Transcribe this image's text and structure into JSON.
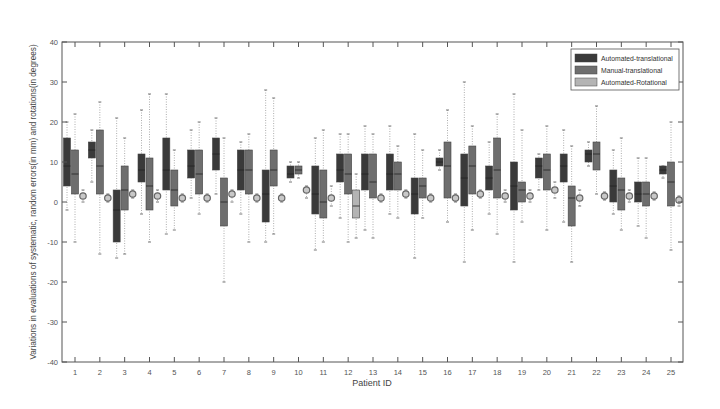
{
  "chart_data": {
    "type": "boxplot",
    "title": "",
    "xlabel": "Patient ID",
    "ylabel": "Variations in evaluations of systematic, random errors(in mm) and rotations(in degrees)",
    "ylim": [
      -40,
      40
    ],
    "yticks": [
      -40,
      -30,
      -20,
      -10,
      0,
      10,
      20,
      30,
      40
    ],
    "categories": [
      "1",
      "2",
      "3",
      "4",
      "5",
      "6",
      "7",
      "8",
      "9",
      "10",
      "11",
      "12",
      "13",
      "14",
      "15",
      "16",
      "17",
      "18",
      "19",
      "20",
      "21",
      "22",
      "23",
      "24",
      "25"
    ],
    "grid": false,
    "legend_position": "top-right",
    "series": [
      {
        "name": "Automated-translational",
        "color": "#3a3a3a",
        "boxes": [
          {
            "min": -2,
            "q1": 4,
            "median": 9,
            "q3": 16,
            "max": 20
          },
          {
            "min": 5,
            "q1": 11,
            "median": 13,
            "q3": 15,
            "max": 18
          },
          {
            "min": -14,
            "q1": -10,
            "median": -2,
            "q3": 3,
            "max": 21
          },
          {
            "min": -3,
            "q1": 5,
            "median": 8,
            "q3": 12,
            "max": 23
          },
          {
            "min": -8,
            "q1": 3,
            "median": 8,
            "q3": 16,
            "max": 27
          },
          {
            "min": 1,
            "q1": 6,
            "median": 9,
            "q3": 13,
            "max": 18
          },
          {
            "min": 2,
            "q1": 8,
            "median": 12,
            "q3": 16,
            "max": 21
          },
          {
            "min": -3,
            "q1": 3,
            "median": 8,
            "q3": 13,
            "max": 15
          },
          {
            "min": -10,
            "q1": -5,
            "median": 2,
            "q3": 8,
            "max": 28
          },
          {
            "min": 5,
            "q1": 6,
            "median": 7,
            "q3": 9,
            "max": 10
          },
          {
            "min": -12,
            "q1": -3,
            "median": 2,
            "q3": 9,
            "max": 16
          },
          {
            "min": -4,
            "q1": 5,
            "median": 8,
            "q3": 12,
            "max": 17
          },
          {
            "min": -7,
            "q1": 3,
            "median": 7,
            "q3": 12,
            "max": 19
          },
          {
            "min": -3,
            "q1": 3,
            "median": 7,
            "q3": 12,
            "max": 19
          },
          {
            "min": -14,
            "q1": -3,
            "median": 2,
            "q3": 6,
            "max": 17
          },
          {
            "min": 8,
            "q1": 9,
            "median": 10,
            "q3": 11,
            "max": 13
          },
          {
            "min": -15,
            "q1": -1,
            "median": 6,
            "q3": 12,
            "max": 30
          },
          {
            "min": -3,
            "q1": 3,
            "median": 6,
            "q3": 9,
            "max": 15
          },
          {
            "min": -15,
            "q1": -2,
            "median": 4,
            "q3": 10,
            "max": 27
          },
          {
            "min": 3,
            "q1": 6,
            "median": 9,
            "q3": 11,
            "max": 12
          },
          {
            "min": -5,
            "q1": 5,
            "median": 9,
            "q3": 12,
            "max": 18
          },
          {
            "min": 9,
            "q1": 10,
            "median": 12,
            "q3": 13,
            "max": 15
          },
          {
            "min": -3,
            "q1": 0,
            "median": 4,
            "q3": 8,
            "max": 13
          },
          {
            "min": -6,
            "q1": 0,
            "median": 2,
            "q3": 5,
            "max": 11
          },
          {
            "min": 6,
            "q1": 7,
            "median": 8,
            "q3": 9,
            "max": 9
          }
        ]
      },
      {
        "name": "Manual-translational",
        "color": "#6e6e6e",
        "boxes": [
          {
            "min": -10,
            "q1": 2,
            "median": 7,
            "q3": 13,
            "max": 22
          },
          {
            "min": -13,
            "q1": 2,
            "median": 9,
            "q3": 18,
            "max": 25
          },
          {
            "min": -13,
            "q1": -2,
            "median": 3,
            "q3": 9,
            "max": 16
          },
          {
            "min": -10,
            "q1": -2,
            "median": 4,
            "q3": 11,
            "max": 27
          },
          {
            "min": -7,
            "q1": -1,
            "median": 3,
            "q3": 8,
            "max": 13
          },
          {
            "min": -3,
            "q1": 2,
            "median": 7,
            "q3": 13,
            "max": 20
          },
          {
            "min": -20,
            "q1": -6,
            "median": 0,
            "q3": 6,
            "max": 16
          },
          {
            "min": -10,
            "q1": 2,
            "median": 8,
            "q3": 13,
            "max": 17
          },
          {
            "min": -8,
            "q1": 4,
            "median": 8,
            "q3": 13,
            "max": 26
          },
          {
            "min": 6,
            "q1": 7,
            "median": 8,
            "q3": 9,
            "max": 10
          },
          {
            "min": -10,
            "q1": -4,
            "median": 0,
            "q3": 8,
            "max": 18
          },
          {
            "min": -10,
            "q1": 2,
            "median": 7,
            "q3": 12,
            "max": 17
          },
          {
            "min": -9,
            "q1": 1,
            "median": 5,
            "q3": 12,
            "max": 17
          },
          {
            "min": -4,
            "q1": 3,
            "median": 7,
            "q3": 10,
            "max": 14
          },
          {
            "min": -4,
            "q1": 1,
            "median": 4,
            "q3": 6,
            "max": 13
          },
          {
            "min": -5,
            "q1": 1,
            "median": 9,
            "q3": 15,
            "max": 23
          },
          {
            "min": -7,
            "q1": 2,
            "median": 9,
            "q3": 14,
            "max": 19
          },
          {
            "min": -8,
            "q1": 1,
            "median": 8,
            "q3": 16,
            "max": 22
          },
          {
            "min": -5,
            "q1": 0,
            "median": 3,
            "q3": 5,
            "max": 18
          },
          {
            "min": -7,
            "q1": 3,
            "median": 8,
            "q3": 12,
            "max": 19
          },
          {
            "min": -15,
            "q1": -6,
            "median": 1,
            "q3": 4,
            "max": 14
          },
          {
            "min": 2,
            "q1": 8,
            "median": 12,
            "q3": 15,
            "max": 24
          },
          {
            "min": -7,
            "q1": -2,
            "median": 3,
            "q3": 6,
            "max": 16
          },
          {
            "min": -9,
            "q1": -1,
            "median": 2,
            "q3": 5,
            "max": 11
          },
          {
            "min": -12,
            "q1": -1,
            "median": 5,
            "q3": 10,
            "max": 20
          }
        ]
      },
      {
        "name": "Automated-Rotational",
        "color": "#b4b4b4",
        "boxes": [
          {
            "min": 0,
            "q1": 1,
            "median": 1.5,
            "q3": 2,
            "max": 3
          },
          {
            "min": 0,
            "q1": 0.5,
            "median": 1,
            "q3": 1.5,
            "max": 2
          },
          {
            "min": 1,
            "q1": 1.5,
            "median": 2,
            "q3": 2.5,
            "max": 3
          },
          {
            "min": 0,
            "q1": 1,
            "median": 1.5,
            "q3": 2,
            "max": 3
          },
          {
            "min": 0,
            "q1": 0.5,
            "median": 1,
            "q3": 1.5,
            "max": 2
          },
          {
            "min": 0,
            "q1": 0.5,
            "median": 1,
            "q3": 1.5,
            "max": 2
          },
          {
            "min": 0,
            "q1": 1,
            "median": 2,
            "q3": 2.5,
            "max": 3
          },
          {
            "min": 0,
            "q1": 0.5,
            "median": 1,
            "q3": 1.5,
            "max": 2
          },
          {
            "min": 0,
            "q1": 0.5,
            "median": 1,
            "q3": 1.5,
            "max": 2
          },
          {
            "min": 1,
            "q1": 2,
            "median": 3,
            "q3": 3.5,
            "max": 4
          },
          {
            "min": -1,
            "q1": 0,
            "median": 1,
            "q3": 2,
            "max": 4
          },
          {
            "min": -9,
            "q1": -4,
            "median": -1,
            "q3": 3,
            "max": 7
          },
          {
            "min": 0,
            "q1": 0.5,
            "median": 1,
            "q3": 1.5,
            "max": 2
          },
          {
            "min": 1,
            "q1": 1.5,
            "median": 2,
            "q3": 2.5,
            "max": 3
          },
          {
            "min": 0,
            "q1": 0.5,
            "median": 1,
            "q3": 1.5,
            "max": 2
          },
          {
            "min": 0,
            "q1": 0.5,
            "median": 1,
            "q3": 1.5,
            "max": 2
          },
          {
            "min": 1,
            "q1": 1.5,
            "median": 2,
            "q3": 2.5,
            "max": 3
          },
          {
            "min": 0,
            "q1": 1,
            "median": 1.5,
            "q3": 2.5,
            "max": 3
          },
          {
            "min": 0,
            "q1": 1,
            "median": 1.5,
            "q3": 2.5,
            "max": 3
          },
          {
            "min": 1,
            "q1": 2,
            "median": 3,
            "q3": 4,
            "max": 5
          },
          {
            "min": -1,
            "q1": 0,
            "median": 1,
            "q3": 2,
            "max": 3
          },
          {
            "min": 0.5,
            "q1": 1,
            "median": 1.5,
            "q3": 2,
            "max": 2.5
          },
          {
            "min": 0,
            "q1": 1,
            "median": 1.5,
            "q3": 2,
            "max": 3
          },
          {
            "min": 0.5,
            "q1": 1,
            "median": 1.5,
            "q3": 2,
            "max": 2.5
          },
          {
            "min": -1,
            "q1": 0,
            "median": 0.5,
            "q3": 1,
            "max": 1.5
          }
        ]
      }
    ]
  }
}
